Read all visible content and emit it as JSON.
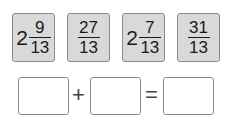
{
  "cards": [
    {
      "whole": "2",
      "numerator": "9",
      "denominator": "13"
    },
    {
      "whole": "",
      "numerator": "27",
      "denominator": "13"
    },
    {
      "whole": "2",
      "numerator": "7",
      "denominator": "13"
    },
    {
      "whole": "",
      "numerator": "31",
      "denominator": "13"
    }
  ],
  "equation": {
    "plus": "+",
    "equals": "=",
    "boxes": [
      "",
      "",
      ""
    ]
  }
}
